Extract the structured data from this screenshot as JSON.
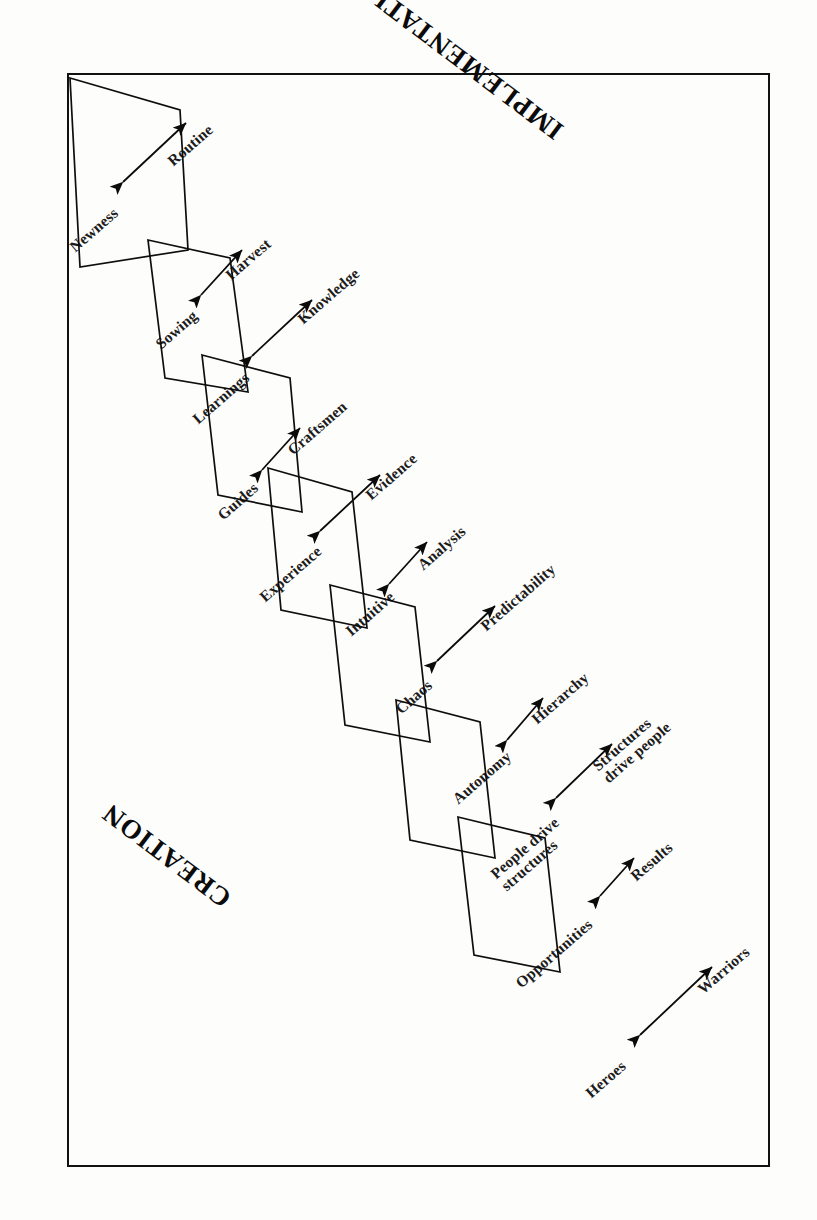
{
  "figure": {
    "kind": "polarity-chain-diagram",
    "orientation_note": "landscape figure rotated 90° within a portrait page",
    "phases": [
      {
        "id": "implementation",
        "label": "IMPLEMENTATION",
        "x": 560,
        "y": 118,
        "rotate": 217
      },
      {
        "id": "creation",
        "label": "CREATION",
        "x": 228,
        "y": 886,
        "rotate": 217
      }
    ],
    "border": {
      "x": 67,
      "y": 73,
      "width": 703,
      "height": 1094,
      "color": "#111111",
      "stroke": 2.5
    },
    "quads": [
      {
        "id": "q1",
        "points": "70,78 180,110 188,250 80,267"
      },
      {
        "id": "q2",
        "points": "148,240 230,258 248,392 165,378"
      },
      {
        "id": "q3",
        "points": "202,355 290,378 302,512 218,495"
      },
      {
        "id": "q4",
        "points": "268,468 352,492 367,628 281,610"
      },
      {
        "id": "q5",
        "points": "330,585 415,607 430,742 345,725"
      },
      {
        "id": "q6",
        "points": "396,700 480,722 495,858 410,840"
      },
      {
        "id": "q7",
        "points": "458,817 545,838 560,972 474,955"
      }
    ],
    "links": [
      {
        "id": "l1",
        "from": "Newness",
        "to": "Routine",
        "arrow": {
          "x1": 123,
          "y1": 182,
          "x2": 186,
          "y2": 123
        },
        "from_pos": {
          "x": 72,
          "y": 240,
          "rotate": -41
        },
        "to_pos": {
          "x": 170,
          "y": 154,
          "rotate": -41
        }
      },
      {
        "id": "l2",
        "from": "Sowing",
        "to": "Harvest",
        "arrow": {
          "x1": 201,
          "y1": 295,
          "x2": 242,
          "y2": 250
        },
        "from_pos": {
          "x": 158,
          "y": 337,
          "rotate": -41
        },
        "to_pos": {
          "x": 228,
          "y": 268,
          "rotate": -41
        }
      },
      {
        "id": "l3",
        "from": "Learnings",
        "to": "Knowledge",
        "arrow": {
          "x1": 252,
          "y1": 356,
          "x2": 312,
          "y2": 300
        },
        "from_pos": {
          "x": 195,
          "y": 412,
          "rotate": -41
        },
        "to_pos": {
          "x": 300,
          "y": 312,
          "rotate": -41
        }
      },
      {
        "id": "l4",
        "from": "Guides",
        "to": "Craftsmen",
        "arrow": {
          "x1": 262,
          "y1": 470,
          "x2": 300,
          "y2": 428
        },
        "from_pos": {
          "x": 220,
          "y": 508,
          "rotate": -41
        },
        "to_pos": {
          "x": 290,
          "y": 443,
          "rotate": -41
        }
      },
      {
        "id": "l5",
        "from": "Experience",
        "to": "Evidence",
        "arrow": {
          "x1": 320,
          "y1": 531,
          "x2": 380,
          "y2": 475
        },
        "from_pos": {
          "x": 262,
          "y": 590,
          "rotate": -41
        },
        "to_pos": {
          "x": 368,
          "y": 488,
          "rotate": -41
        }
      },
      {
        "id": "l6",
        "from": "Intuitive",
        "to": "Analysis",
        "arrow": {
          "x1": 389,
          "y1": 584,
          "x2": 427,
          "y2": 542
        },
        "from_pos": {
          "x": 348,
          "y": 624,
          "rotate": -41
        },
        "to_pos": {
          "x": 420,
          "y": 558,
          "rotate": -41
        }
      },
      {
        "id": "l7",
        "from": "Chaos",
        "to": "Predictability",
        "arrow": {
          "x1": 437,
          "y1": 661,
          "x2": 495,
          "y2": 606
        },
        "from_pos": {
          "x": 398,
          "y": 702,
          "rotate": -41
        },
        "to_pos": {
          "x": 483,
          "y": 619,
          "rotate": -41
        }
      },
      {
        "id": "l8",
        "from": "Autonomy",
        "to": "Hierarchy",
        "arrow": {
          "x1": 507,
          "y1": 740,
          "x2": 543,
          "y2": 698
        },
        "from_pos": {
          "x": 455,
          "y": 792,
          "rotate": -41
        },
        "to_pos": {
          "x": 534,
          "y": 712,
          "rotate": -41
        }
      },
      {
        "id": "l9",
        "from": "People drive\nstructures",
        "to": "Structures\ndrive people",
        "arrow": {
          "x1": 556,
          "y1": 798,
          "x2": 612,
          "y2": 744
        },
        "from_pos": {
          "x": 498,
          "y": 866,
          "rotate": -41
        },
        "to_pos": {
          "x": 600,
          "y": 758,
          "rotate": -41
        }
      },
      {
        "id": "l10",
        "from": "Opportunities",
        "to": "Results",
        "arrow": {
          "x1": 600,
          "y1": 896,
          "x2": 634,
          "y2": 858
        },
        "from_pos": {
          "x": 518,
          "y": 976,
          "rotate": -41
        },
        "to_pos": {
          "x": 633,
          "y": 869,
          "rotate": -41
        }
      },
      {
        "id": "l11",
        "from": "Heroes",
        "to": "Warriors",
        "arrow": {
          "x1": 640,
          "y1": 1035,
          "x2": 712,
          "y2": 967
        },
        "from_pos": {
          "x": 588,
          "y": 1086,
          "rotate": -41
        },
        "to_pos": {
          "x": 700,
          "y": 982,
          "rotate": -41
        }
      }
    ]
  }
}
